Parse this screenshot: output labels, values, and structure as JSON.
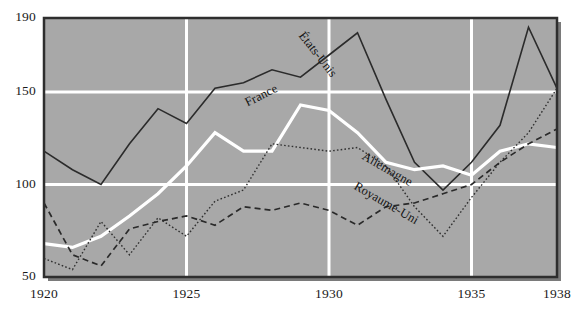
{
  "chart_data": {
    "type": "line",
    "title": "",
    "subtitle": "",
    "xlabel": "",
    "ylabel": "",
    "x": [
      1920,
      1921,
      1922,
      1923,
      1924,
      1925,
      1926,
      1927,
      1928,
      1929,
      1930,
      1931,
      1932,
      1933,
      1934,
      1935,
      1936,
      1937,
      1938
    ],
    "xlim": [
      1920,
      1938
    ],
    "ylim": [
      50,
      190
    ],
    "y_ticks": [
      50,
      100,
      150,
      190
    ],
    "x_ticks": [
      1920,
      1925,
      1930,
      1935,
      1938
    ],
    "gridlines": {
      "x": [
        1925,
        1930,
        1935
      ],
      "y": [
        100,
        150
      ],
      "color": "#ffffff",
      "on": true
    },
    "plot_background": "#a8a8a8",
    "legend_position": "inline-labels",
    "series": [
      {
        "name": "États-Unis",
        "style": "solid",
        "color": "#2b2b2b",
        "width": 1.6,
        "label_x": 1929.0,
        "label_y": 182,
        "label_rotation": 52,
        "values": [
          118,
          108,
          100,
          122,
          141,
          133,
          152,
          155,
          162,
          158,
          170,
          182,
          146,
          112,
          97,
          112,
          132,
          185,
          152
        ]
      },
      {
        "name": "France",
        "style": "solid",
        "color": "#ffffff",
        "width": 3.2,
        "label_x": 1927.1,
        "label_y": 144,
        "label_rotation": -27,
        "values": [
          68,
          66,
          72,
          83,
          95,
          110,
          128,
          118,
          118,
          143,
          140,
          128,
          112,
          108,
          110,
          105,
          118,
          122,
          120
        ]
      },
      {
        "name": "Allemagne",
        "style": "dotted",
        "color": "#303030",
        "width": 1.4,
        "label_x": 1931.2,
        "label_y": 116,
        "label_rotation": 30,
        "values": [
          60,
          54,
          80,
          62,
          82,
          72,
          91,
          97,
          122,
          120,
          118,
          120,
          110,
          88,
          72,
          93,
          112,
          128,
          152
        ]
      },
      {
        "name": "Royaume-Uni",
        "style": "dashed",
        "color": "#2a2a2a",
        "width": 1.7,
        "label_x": 1930.9,
        "label_y": 100,
        "label_rotation": 30,
        "values": [
          90,
          62,
          56,
          76,
          80,
          83,
          78,
          88,
          86,
          90,
          86,
          78,
          88,
          90,
          95,
          100,
          112,
          122,
          130
        ]
      }
    ]
  },
  "axis": {
    "y_tick_labels": [
      "190",
      "150",
      "100",
      "50"
    ],
    "x_tick_labels": [
      "1920",
      "1925",
      "1930",
      "1935",
      "1938"
    ]
  },
  "labels": {
    "etats_unis": "États-Unis",
    "france": "France",
    "allemagne": "Allemagne",
    "royaume_uni": "Royaume-Uni"
  },
  "colors": {
    "plot_bg": "#a8a8a8",
    "page_bg": "#ffffff",
    "grid": "#ffffff",
    "frame": "#2e2e2e",
    "shadow": "#7a7a7a",
    "text": "#1a1a1a"
  }
}
